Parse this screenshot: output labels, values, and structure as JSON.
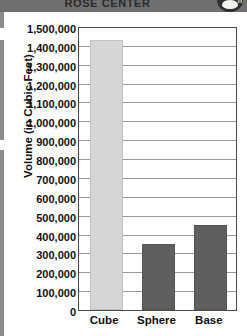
{
  "header": {
    "title": "ROSE CENTER",
    "badge_letter": "h",
    "band_color": "#6f6f6f"
  },
  "chart_data": {
    "type": "bar",
    "title": "",
    "xlabel": "",
    "ylabel": "Volume (in Cubic Feet)",
    "categories": [
      "Cube",
      "Sphere",
      "Base"
    ],
    "values": [
      1420000,
      340000,
      440000
    ],
    "series": [
      {
        "name": "Volume",
        "values": [
          1420000,
          340000,
          440000
        ]
      }
    ],
    "ylim": [
      0,
      1500000
    ],
    "ytick_step": 100000,
    "ytick_labels": [
      "1,500,000",
      "1,400,000",
      "1,300,000",
      "1,200,000",
      "1,100,000",
      "1,000,000",
      "900,000",
      "800,000",
      "700,000",
      "600,000",
      "500,000",
      "400,000",
      "300,000",
      "200,000",
      "100,000",
      "0"
    ],
    "grid": true,
    "legend": "none",
    "bar_colors": [
      "#d6d6d6",
      "#5f5f5f",
      "#5f5f5f"
    ],
    "gridline_color": "#9a9a9a",
    "axis_color": "#4a4a4a"
  }
}
